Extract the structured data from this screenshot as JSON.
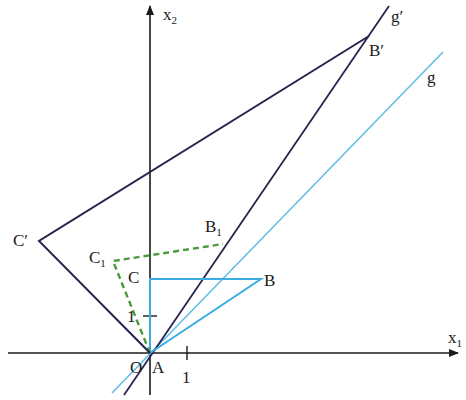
{
  "colors": {
    "axis": "#1a1a1a",
    "image_figure": "#2a2350",
    "original_figure": "#3aaee0",
    "intermediate_figure": "#4a9a3a",
    "line_g": "#5bbde6",
    "line_g_prime": "#2a2350"
  },
  "axes": {
    "x1_label": "x",
    "x1_sub": "1",
    "x2_label": "x",
    "x2_sub": "2",
    "x_tick_label": "1",
    "y_tick_label": "1"
  },
  "points": {
    "A": "A",
    "O": "O",
    "B": "B",
    "C": "C",
    "B1": "B",
    "B1_sub": "1",
    "C1": "C",
    "C1_sub": "1",
    "B_prime": "B′",
    "C_prime": "C′"
  },
  "lines": {
    "g": "g",
    "g_prime": "g′"
  },
  "figures": {
    "original_triangle": {
      "name": "ABC",
      "style": "solid",
      "color": "light-blue"
    },
    "intermediate_triangle": {
      "name": "AB1C1",
      "style": "dashed",
      "color": "green"
    },
    "image_triangle": {
      "name": "AB′C′",
      "style": "solid",
      "color": "dark-purple"
    }
  }
}
